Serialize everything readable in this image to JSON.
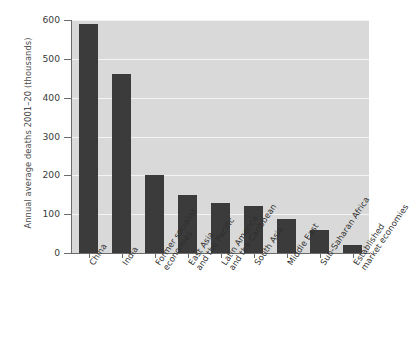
{
  "chart_data": {
    "type": "bar",
    "title": "",
    "subtitle": "",
    "xlabel": "",
    "ylabel": "Annual average deaths 2001–20 (thousands)",
    "ylim": [
      0,
      600
    ],
    "yticks": [
      0,
      100,
      200,
      300,
      400,
      500,
      600
    ],
    "ytick_labels": [
      "0",
      "100",
      "200",
      "300",
      "400",
      "500",
      "600"
    ],
    "grid": "horizontal-white",
    "legend": "none",
    "categories": [
      "China",
      "India",
      "Former socialist\neconomies",
      "East Asia\nand the Pacific",
      "Latin America\nand the Caribbean",
      "South Asia",
      "Middle East",
      "Sub-Saharan Africa",
      "Established\nmarket economies"
    ],
    "values": [
      590,
      460,
      200,
      150,
      130,
      120,
      88,
      58,
      20
    ],
    "series": [
      {
        "name": "Annual average deaths 2001-20 (thousands)",
        "values": [
          590,
          460,
          200,
          150,
          130,
          120,
          88,
          58,
          20
        ]
      }
    ],
    "colors": {
      "bar": "#3b3b3b",
      "plot_background": "#d9d9d9",
      "gridline": "#f4f4f4",
      "axis": "#6b6b6b",
      "figure_background": "#ffffff",
      "text": "#2e2e2e"
    }
  }
}
